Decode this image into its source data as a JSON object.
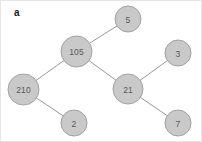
{
  "figure": {
    "panel_letter": "a",
    "background_color": "#ffffff",
    "border_color": "#e6e6e6",
    "width": 202,
    "height": 142
  },
  "style": {
    "node_fill": "#c9c9c9",
    "node_stroke": "#a2a2a2",
    "node_text_color": "#5a5a5a",
    "edge_color": "#8c8c8c"
  },
  "chart_data": {
    "type": "diagram",
    "diagram_type": "binary-tree",
    "title": "",
    "root": "105",
    "nodes": [
      {
        "id": "n105",
        "label": "105",
        "x": 75.5,
        "y": 50.5,
        "r": 15.5
      },
      {
        "id": "n5",
        "label": "5",
        "x": 127.0,
        "y": 18.0,
        "r": 13.0
      },
      {
        "id": "n210",
        "label": "210",
        "x": 22.5,
        "y": 88.5,
        "r": 15.5
      },
      {
        "id": "n21",
        "label": "21",
        "x": 127.0,
        "y": 88.0,
        "r": 15.0
      },
      {
        "id": "n2",
        "label": "2",
        "x": 73.0,
        "y": 122.0,
        "r": 13.0
      },
      {
        "id": "n3",
        "label": "3",
        "x": 177.0,
        "y": 52.0,
        "r": 13.0
      },
      {
        "id": "n7",
        "label": "7",
        "x": 177.0,
        "y": 122.0,
        "r": 13.0
      }
    ],
    "edges": [
      {
        "from": "n105",
        "to": "n5"
      },
      {
        "from": "n105",
        "to": "n210"
      },
      {
        "from": "n105",
        "to": "n21"
      },
      {
        "from": "n210",
        "to": "n2"
      },
      {
        "from": "n21",
        "to": "n3"
      },
      {
        "from": "n21",
        "to": "n7"
      }
    ]
  }
}
